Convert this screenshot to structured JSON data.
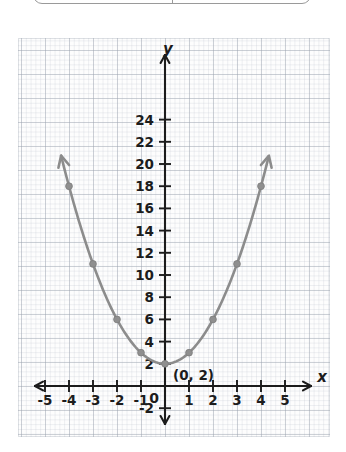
{
  "top_table": {
    "columns": 2,
    "cells": [
      "",
      ""
    ]
  },
  "chart_data": {
    "type": "line",
    "title": "",
    "xlabel": "x",
    "ylabel": "y",
    "equation": "y = x^2 + 2",
    "grid": true,
    "legend": "none",
    "xlim": [
      -5.6,
      5.6
    ],
    "ylim": [
      -3,
      26
    ],
    "x_ticks": [
      -5,
      -4,
      -3,
      -2,
      -1,
      0,
      1,
      2,
      3,
      4,
      5
    ],
    "x_tick_labels": [
      "-5",
      "-4",
      "-3",
      "-2",
      "-1",
      "0",
      "1",
      "2",
      "3",
      "4",
      "5"
    ],
    "y_ticks": [
      -2,
      2,
      4,
      6,
      8,
      10,
      12,
      14,
      16,
      18,
      20,
      22,
      24
    ],
    "y_tick_labels": [
      "-2",
      "2",
      "4",
      "6",
      "8",
      "10",
      "12",
      "14",
      "16",
      "18",
      "20",
      "22",
      "24"
    ],
    "series": [
      {
        "name": "y = x^2 + 2",
        "color": "#8c8c8c",
        "x": [
          -4,
          -3,
          -2,
          -1,
          0,
          1,
          2,
          3,
          4
        ],
        "values": [
          18,
          11,
          6,
          3,
          2,
          3,
          6,
          11,
          18
        ]
      }
    ],
    "annotations": [
      {
        "text": "(0, 2)",
        "x": 0,
        "y": 2
      }
    ],
    "axis_arrows": [
      "left",
      "right",
      "up",
      "down"
    ],
    "curve_arrows": [
      "up-left",
      "up-right"
    ]
  }
}
